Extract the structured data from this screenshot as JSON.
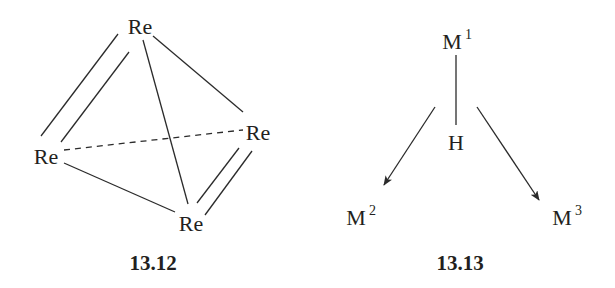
{
  "figures": [
    {
      "id": "13.12",
      "label": "13.12",
      "atoms": {
        "top": "Re",
        "left": "Re",
        "right": "Re",
        "bottom": "Re"
      },
      "bonds": [
        {
          "from": "top",
          "to": "left",
          "type": "double"
        },
        {
          "from": "top",
          "to": "bottom",
          "type": "single"
        },
        {
          "from": "top",
          "to": "right",
          "type": "single"
        },
        {
          "from": "left",
          "to": "right",
          "type": "dashed"
        },
        {
          "from": "left",
          "to": "bottom",
          "type": "single"
        },
        {
          "from": "right",
          "to": "bottom",
          "type": "double"
        }
      ]
    },
    {
      "id": "13.13",
      "label": "13.13",
      "atoms": {
        "m1": {
          "symbol": "M",
          "superscript": "1"
        },
        "h": {
          "symbol": "H"
        },
        "m2": {
          "symbol": "M",
          "superscript": "2"
        },
        "m3": {
          "symbol": "M",
          "superscript": "3"
        }
      },
      "bonds": [
        {
          "from": "m1",
          "to": "h",
          "type": "single"
        },
        {
          "from": "h",
          "to": "m2",
          "type": "arrow"
        },
        {
          "from": "h",
          "to": "m3",
          "type": "arrow"
        }
      ]
    }
  ],
  "colors": {
    "ink": "#231f20",
    "background": "#ffffff"
  }
}
